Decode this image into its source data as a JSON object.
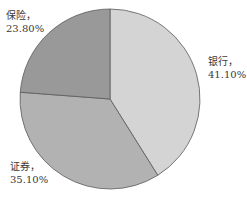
{
  "chart_data": {
    "type": "pie",
    "title": "",
    "categories": [
      "银行",
      "证券",
      "保险"
    ],
    "values": [
      41.1,
      35.1,
      23.8
    ],
    "labels": [
      "银行，41.10%",
      "证券，35.10%",
      "保险，23.80%"
    ],
    "start_angle_deg": 0,
    "direction": "clockwise",
    "legend": "none",
    "colors": [
      "#d4d4d4",
      "#b2b2b2",
      "#999999"
    ]
  },
  "labels": {
    "bank": {
      "name": "银行，",
      "pct": "41.10%"
    },
    "securities": {
      "name": "证券，",
      "pct": "35.10%"
    },
    "insurance": {
      "name": "保险，",
      "pct": "23.80%"
    }
  }
}
